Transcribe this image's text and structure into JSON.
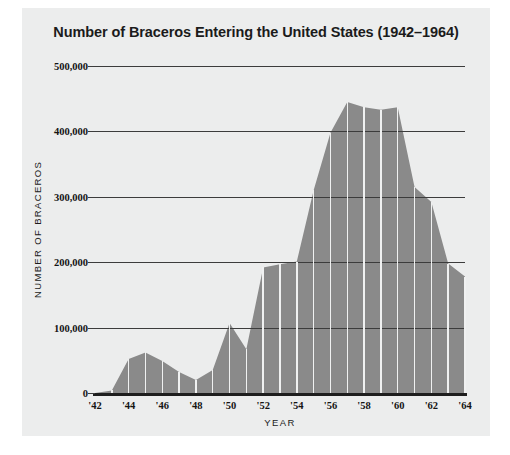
{
  "chart_data": {
    "type": "area",
    "title": "Number of Braceros Entering the United States (1942–1964)",
    "xlabel": "YEAR",
    "ylabel": "NUMBER OF BRACEROS",
    "x": [
      1942,
      1943,
      1944,
      1945,
      1946,
      1947,
      1948,
      1949,
      1950,
      1951,
      1952,
      1953,
      1954,
      1955,
      1956,
      1957,
      1958,
      1959,
      1960,
      1961,
      1962,
      1963,
      1964
    ],
    "values": [
      0,
      4000,
      52000,
      62000,
      49000,
      32000,
      20000,
      35000,
      107000,
      67000,
      192000,
      197000,
      201000,
      310000,
      398000,
      445000,
      437000,
      433000,
      437000,
      315000,
      292000,
      198000,
      178000
    ],
    "ylim": [
      0,
      500000
    ],
    "xlim": [
      1942,
      1964
    ],
    "ytick_values": [
      0,
      100000,
      200000,
      300000,
      400000,
      500000
    ],
    "ytick_labels": [
      "0",
      "100,000",
      "200,000",
      "300,000",
      "400,000",
      "500,000"
    ],
    "xtick_values": [
      1942,
      1944,
      1946,
      1948,
      1950,
      1952,
      1954,
      1956,
      1958,
      1960,
      1962,
      1964
    ],
    "xtick_labels": [
      "'42",
      "'44",
      "'46",
      "'48",
      "'50",
      "'52",
      "'54",
      "'56",
      "'58",
      "'60",
      "'62",
      "'64"
    ],
    "grid": true,
    "legend": null,
    "area_color": "#8a8a8a",
    "grid_color": "#3c3c3c",
    "axis_color": "#1e1e1e",
    "divider_color": "#f0f1f1",
    "panel_background": "#eceded",
    "page_background": "#ffffff",
    "text_color": "#141414"
  }
}
